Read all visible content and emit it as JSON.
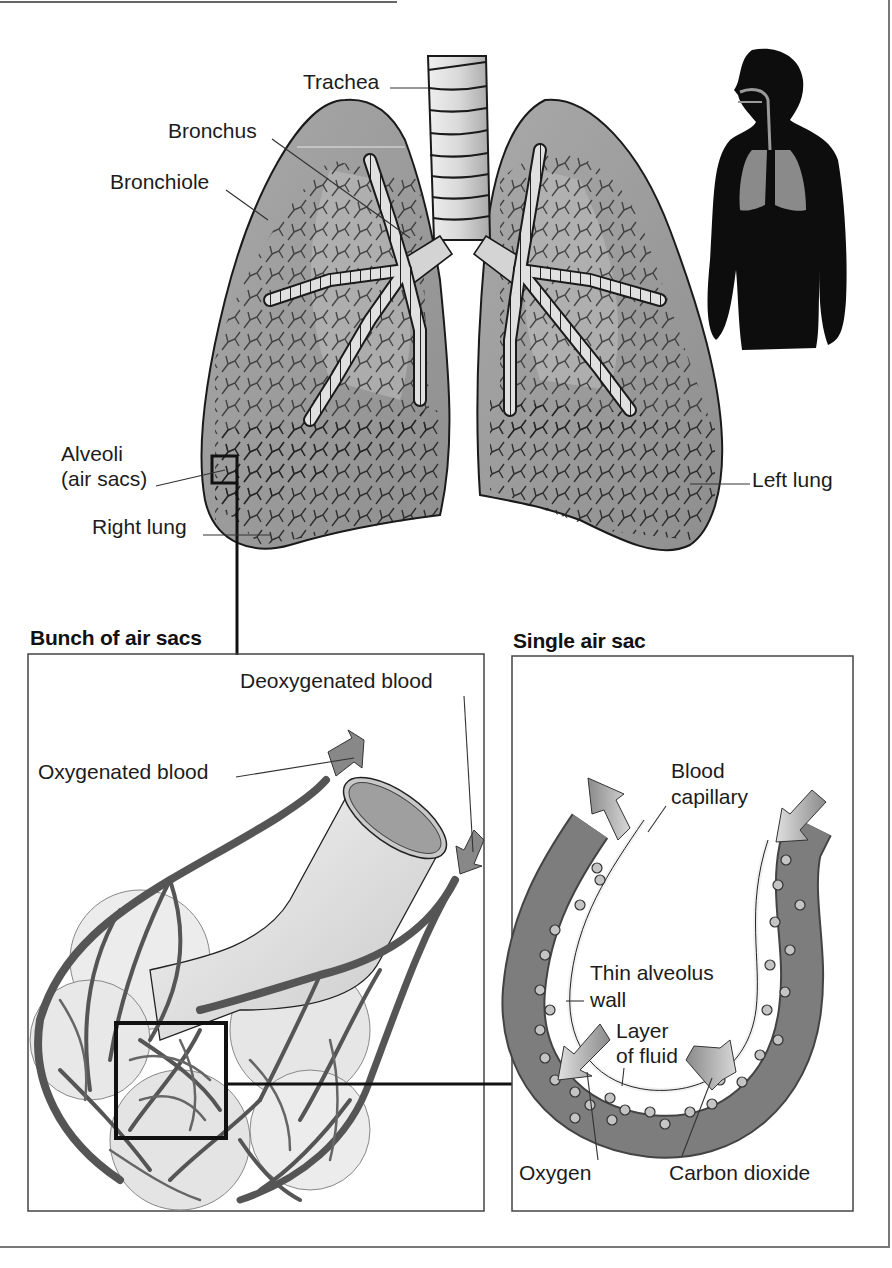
{
  "diagram": {
    "title_main": "Human respiratory system",
    "lungs": {
      "labels": {
        "trachea": "Trachea",
        "bronchus": "Bronchus",
        "bronchiole": "Bronchiole",
        "alveoli_line1": "Alveoli",
        "alveoli_line2": "(air sacs)",
        "right_lung": "Right lung",
        "left_lung": "Left lung"
      }
    },
    "silhouette": {
      "description": "Human silhouette showing lungs and airway"
    },
    "bunch_panel": {
      "heading": "Bunch of air sacs",
      "labels": {
        "deoxygenated": "Deoxygenated blood",
        "oxygenated": "Oxygenated blood"
      }
    },
    "single_panel": {
      "heading": "Single air sac",
      "labels": {
        "capillary_line1": "Blood",
        "capillary_line2": "capillary",
        "wall_line1": "Thin alveolus",
        "wall_line2": "wall",
        "fluid_line1": "Layer",
        "fluid_line2": "of fluid",
        "oxygen": "Oxygen",
        "co2": "Carbon dioxide"
      }
    },
    "colors": {
      "lung_fill": "#9a9a9a",
      "lung_inner": "#b8b8b8",
      "airway": "#d6d6d6",
      "vessel": "#6e6e6e",
      "capillary": "#7d7d7d",
      "silhouette": "#0d0d0d",
      "border": "#555555"
    }
  }
}
